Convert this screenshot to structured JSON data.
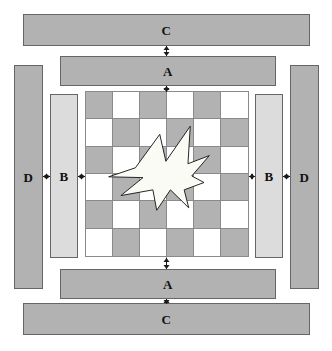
{
  "diagram": {
    "canvas": {
      "width": 332,
      "height": 351,
      "background": "#ffffff"
    },
    "colors": {
      "bar_dark": "#b2b2b2",
      "bar_light": "#dcdcdc",
      "bar_border": "#666666",
      "cell_dark": "#b2b2b2",
      "cell_light": "#ffffff",
      "grid_line": "#8a8a8a",
      "star_fill": "#fbfbf5",
      "star_stroke": "#1a1a1a",
      "text": "#111111"
    },
    "bars": [
      {
        "name": "top-c-bar",
        "label": "C",
        "style": "dark",
        "x": 23,
        "y": 14,
        "w": 287,
        "h": 32
      },
      {
        "name": "top-a-bar",
        "label": "A",
        "style": "dark",
        "x": 60,
        "y": 56,
        "w": 216,
        "h": 30
      },
      {
        "name": "left-d-bar",
        "label": "D",
        "style": "dark",
        "x": 14,
        "y": 65,
        "w": 29,
        "h": 224
      },
      {
        "name": "right-d-bar",
        "label": "D",
        "style": "dark",
        "x": 290,
        "y": 65,
        "w": 29,
        "h": 224
      },
      {
        "name": "left-b-bar",
        "label": "B",
        "style": "light",
        "x": 50,
        "y": 94,
        "w": 28,
        "h": 164
      },
      {
        "name": "right-b-bar",
        "label": "B",
        "style": "light",
        "x": 255,
        "y": 94,
        "w": 28,
        "h": 164
      },
      {
        "name": "bottom-a-bar",
        "label": "A",
        "style": "dark",
        "x": 60,
        "y": 269,
        "w": 216,
        "h": 30
      },
      {
        "name": "bottom-c-bar",
        "label": "C",
        "style": "dark",
        "x": 23,
        "y": 303,
        "w": 287,
        "h": 32
      }
    ],
    "checkerboard": {
      "name": "checkerboard",
      "x": 85,
      "y": 91,
      "w": 164,
      "h": 166,
      "columns": 6,
      "rows": 6,
      "first_cell": "dark",
      "pattern": [
        [
          "dark",
          "light",
          "dark",
          "light",
          "dark",
          "light"
        ],
        [
          "light",
          "dark",
          "light",
          "dark",
          "light",
          "dark"
        ],
        [
          "dark",
          "light",
          "dark",
          "light",
          "dark",
          "light"
        ],
        [
          "light",
          "dark",
          "light",
          "dark",
          "light",
          "dark"
        ],
        [
          "dark",
          "light",
          "dark",
          "light",
          "dark",
          "light"
        ],
        [
          "light",
          "dark",
          "light",
          "dark",
          "light",
          "dark"
        ]
      ]
    },
    "star": {
      "name": "star-shape",
      "points": "49,61 81,20 89,53 121,10 118,56 146,46 123,71 139,79 113,88 119,110 95,88 77,113 72,88 30,95 59,73 14,72",
      "viewbox": "0 0 160 120",
      "x": 98,
      "y": 118,
      "w": 122,
      "h": 98
    },
    "arrows": [
      {
        "name": "arrow-top-c-to-a",
        "orientation": "vertical",
        "direction": "both",
        "x": 166,
        "y": 46,
        "length": 10
      },
      {
        "name": "arrow-top-a-to-board",
        "orientation": "vertical",
        "direction": "both",
        "x": 166,
        "y": 86,
        "length": 6
      },
      {
        "name": "arrow-bottom-board-to-a",
        "orientation": "vertical",
        "direction": "both",
        "x": 166,
        "y": 258,
        "length": 11
      },
      {
        "name": "arrow-bottom-a-to-c",
        "orientation": "vertical",
        "direction": "both",
        "x": 166,
        "y": 299,
        "length": 5
      },
      {
        "name": "arrow-left-d-to-b",
        "orientation": "horizontal",
        "direction": "both",
        "x": 43,
        "y": 176,
        "length": 7
      },
      {
        "name": "arrow-left-b-to-board",
        "orientation": "horizontal",
        "direction": "both",
        "x": 78,
        "y": 176,
        "length": 7
      },
      {
        "name": "arrow-right-board-to-b",
        "orientation": "horizontal",
        "direction": "both",
        "x": 249,
        "y": 176,
        "length": 6
      },
      {
        "name": "arrow-right-b-to-d",
        "orientation": "horizontal",
        "direction": "both",
        "x": 283,
        "y": 176,
        "length": 7
      }
    ],
    "connector_lines": [
      {
        "name": "line-top-vertical",
        "orientation": "vertical",
        "x": 166,
        "y1": 46,
        "y2": 299
      },
      {
        "name": "line-middle-horizontal",
        "orientation": "horizontal",
        "y": 176,
        "x1": 43,
        "x2": 290
      }
    ]
  }
}
